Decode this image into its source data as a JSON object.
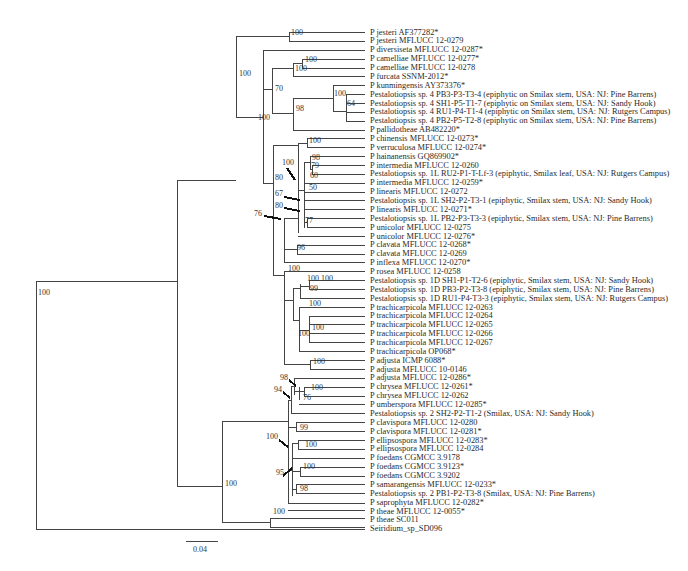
{
  "figure": {
    "type": "phylogenetic-tree",
    "scale_bar": {
      "label": "0.04"
    }
  },
  "taxa": [
    "P jesteri AF377282*",
    "P jesteri MFLUCC 12-0279",
    "P diversiseta MFLUCC 12-0287*",
    "P camelliae MFLUCC 12-0277*",
    "P camelliae MFLUCC 12-0278",
    "P furcata SSNM-2012*",
    "P kunmingensis AY373376*",
    "Pestalotiopsis sp. 4 PB3-P3-T3-4 (epiphytic on Smilax stem, USA: NJ: Pine Barrens)",
    "Pestalotiopsis sp. 4 SH1-P5-T1-7 (epiphytic on Smilax stem, USA: NJ: Sandy Hook)",
    "Pestalotiopsis sp. 4 RU1-P4-T1-4 (epiphytic on Smilax stem, USA: NJ: Rutgers Campus)",
    "Pestalotiopsis sp. 4 PB2-P5-T2-8 (epiphytic on Smilax stem, USA: NJ: Pine Barrens)",
    "P pallidotheae AB482220*",
    "P chinensis MFLUCC 12-0273*",
    "P verruculosa MFLUCC 12-0274*",
    "P hainanensis GQ869902*",
    "P intermedia MFLUCC 12-0260",
    "Pestalotiopsis sp. 1L RU2-P1-T-Lf-3 (epiphytic, Smilax leaf, USA: NJ: Rutgers Campus)",
    "P intermedia MFLUCC 12-0259*",
    "P linearis MFLUCC 12-0272",
    "Pestalotiopsis sp. 1L SH2-P2-T3-1 (epiphytic, Smilax stem, USA: NJ: Sandy Hook)",
    "P linearis MFLUCC 12-0271*",
    "Pestalotiopsis sp. 1L PB2-P3-T3-3 (epiphytic, Smilax stem, USA: NJ: Pine Barrens)",
    "P unicolor MFLUCC 12-0275",
    "P unicolor MFLUCC 12-0276*",
    "P clavata MFLUCC 12-0268*",
    "P clavata MFLUCC 12-0269",
    "P inflexa MFLUCC 12-0270*",
    "P rosea MFLUCC 12-0258",
    "Pestalotiopsis sp. 1D SH1-P1-T2-6 (epiphytic, Smilax stem, USA: NJ: Sandy Hook)",
    "Pestalotiopsis sp. 1D PB3-P2-T3-8 (epiphytic, Smilax stem, USA: NJ: Pine Barrens)",
    "Pestalotiopsis sp. 1D RU1-P4-T3-3 (epiphytic, Smilax stem, USA: NJ: Rutgers Campus)",
    "P trachicarpicola MFLUCC 12-0263",
    "P trachicarpicola MFLUCC 12-0264",
    "P trachicarpicola MFLUCC 12-0265",
    "P trachicarpicola MFLUCC 12-0266",
    "P trachicarpicola MFLUCC 12-0267",
    "P trachicarpicola OP068*",
    "P adjusta ICMP 6088*",
    "P adjusta MFLUCC 10-0146",
    "P adjusta MFLUCC 12-0286*",
    "P chrysea MFLUCC 12-0261*",
    "P chrysea MFLUCC 12-0262",
    "P umberspora MFLUCC 12-0285*",
    "Pestalotiopsis sp. 2 SH2-P2-T1-2 (Smilax, USA: NJ: Sandy Hook)",
    "P clavispora MFLUCC 12-0280",
    "P clavispora MFLUCC 12-0281*",
    "P ellipsospora MFLUCC 12-0283*",
    "P ellipsospora MFLUCC 12-0284",
    "P foedans CGMCC 3.9178",
    "P foedans CGMCC 3.9123*",
    "P foedans CGMCC 3.9202",
    "P samarangensis MFLUCC 12-0233*",
    "Pestalotiopsis sp. 2 PB1-P2-T3-8 (Smilax, USA: NJ: Pine Barrens)",
    "P saprophyta MFLUCC 12-0282*",
    "P theae MFLUCC 12-0055*",
    "P theae SC011",
    "Seiridium_sp_SD096"
  ],
  "bootstrap": [
    {
      "v": "100",
      "x": 38,
      "y": 293
    },
    {
      "v": "100",
      "x": 239,
      "y": 74
    },
    {
      "v": "100",
      "x": 291,
      "y": 33
    },
    {
      "v": "100",
      "x": 258,
      "y": 118
    },
    {
      "v": "70",
      "x": 275,
      "y": 89
    },
    {
      "v": "100",
      "x": 305,
      "y": 60
    },
    {
      "v": "100",
      "x": 295,
      "y": 69
    },
    {
      "v": "98",
      "x": 296,
      "y": 109
    },
    {
      "v": "100",
      "x": 334,
      "y": 94
    },
    {
      "v": "64",
      "x": 347,
      "y": 104
    },
    {
      "v": "80",
      "x": 275,
      "y": 178
    },
    {
      "v": "100",
      "x": 309,
      "y": 141
    },
    {
      "v": "100",
      "x": 282,
      "y": 163
    },
    {
      "v": "98",
      "x": 312,
      "y": 158
    },
    {
      "v": "79",
      "x": 311,
      "y": 166
    },
    {
      "v": "60",
      "x": 310,
      "y": 176
    },
    {
      "v": "50",
      "x": 309,
      "y": 188
    },
    {
      "v": "67",
      "x": 275,
      "y": 194
    },
    {
      "v": "80",
      "x": 275,
      "y": 206
    },
    {
      "v": "76",
      "x": 254,
      "y": 214
    },
    {
      "v": "77",
      "x": 305,
      "y": 221
    },
    {
      "v": "96",
      "x": 297,
      "y": 248
    },
    {
      "v": "100",
      "x": 288,
      "y": 269
    },
    {
      "v": "100",
      "x": 307,
      "y": 279
    },
    {
      "v": "100",
      "x": 321,
      "y": 279
    },
    {
      "v": "99",
      "x": 310,
      "y": 289
    },
    {
      "v": "100",
      "x": 309,
      "y": 304
    },
    {
      "v": "100",
      "x": 312,
      "y": 328
    },
    {
      "v": "100",
      "x": 298,
      "y": 334
    },
    {
      "v": "100",
      "x": 313,
      "y": 362
    },
    {
      "v": "98",
      "x": 280,
      "y": 378
    },
    {
      "v": "94",
      "x": 274,
      "y": 390
    },
    {
      "v": "100",
      "x": 311,
      "y": 388
    },
    {
      "v": "76",
      "x": 303,
      "y": 398
    },
    {
      "v": "99",
      "x": 300,
      "y": 428
    },
    {
      "v": "100",
      "x": 266,
      "y": 437
    },
    {
      "v": "100",
      "x": 305,
      "y": 445
    },
    {
      "v": "100",
      "x": 303,
      "y": 467
    },
    {
      "v": "95",
      "x": 276,
      "y": 473
    },
    {
      "v": "98",
      "x": 300,
      "y": 489
    },
    {
      "v": "100",
      "x": 225,
      "y": 484
    },
    {
      "v": "100",
      "x": 273,
      "y": 512
    }
  ]
}
